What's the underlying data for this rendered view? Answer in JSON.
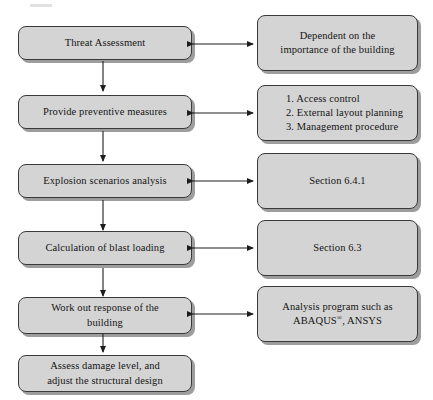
{
  "diagram": {
    "colors": {
      "box_fill": "#d4d4d4",
      "box_border": "#3a3a3a",
      "text": "#141414",
      "arrow": "#1e1e1e",
      "background": "#ffffff"
    },
    "process_steps": [
      {
        "id": "threat-assessment",
        "label": "Threat Assessment"
      },
      {
        "id": "preventive-measures",
        "label": "Provide preventive measures"
      },
      {
        "id": "explosion-scenarios",
        "label": "Explosion scenarios analysis"
      },
      {
        "id": "blast-loading",
        "label": "Calculation of blast loading"
      },
      {
        "id": "building-response",
        "line1": "Work out response of the",
        "line2": "building"
      },
      {
        "id": "assess-damage",
        "line1": "Assess damage level, and",
        "line2": "adjust the structural design"
      }
    ],
    "annotations": [
      {
        "id": "threat-note",
        "line1": "Dependent on the",
        "line2": "importance of the building"
      },
      {
        "id": "measures-note",
        "item1": "1. Access control",
        "item2": "2. External layout planning",
        "item3": "3. Management procedure"
      },
      {
        "id": "scenarios-note",
        "line1": "Section 6.4.1"
      },
      {
        "id": "loading-note",
        "line1": "Section 6.3"
      },
      {
        "id": "response-note",
        "line1": "Analysis program such as",
        "line2_pre": "ABAQUS",
        "line2_mark": "®",
        "line2_post": ", ANSYS"
      }
    ],
    "connectors": {
      "vertical_label": "flow-down-arrow",
      "horizontal_label": "bidirectional-link-arrow"
    }
  }
}
